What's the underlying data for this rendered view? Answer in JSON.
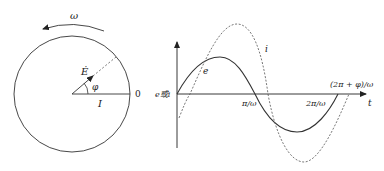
{
  "phasor": {
    "omega_label": "ω",
    "e_vector_label": "Ė",
    "angle_label": "φ",
    "i_axis_label": "I",
    "origin_label": "0"
  },
  "waveform": {
    "y_axis_label": "e或i",
    "x_axis_label": "t",
    "tick_pi": "π/ω",
    "tick_2pi": "2π/ω",
    "tick_2pi_phi": "(2π + φ)/ω",
    "curve_e_label": "e",
    "curve_i_label": "i"
  },
  "colors": {
    "stroke": "#333333",
    "dashed": "#555555",
    "background": "#ffffff"
  }
}
